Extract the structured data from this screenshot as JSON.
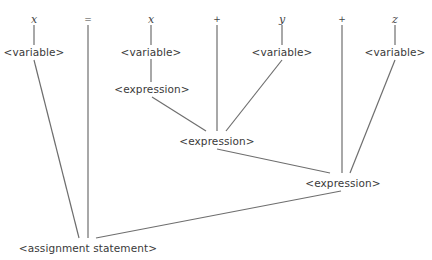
{
  "diagram": {
    "type": "parse-tree",
    "terminals": [
      {
        "id": "t_x1",
        "label": "x",
        "x": 34,
        "y": 19,
        "kind": "identifier"
      },
      {
        "id": "t_eq",
        "label": "=",
        "x": 88,
        "y": 19,
        "kind": "operator"
      },
      {
        "id": "t_x2",
        "label": "x",
        "x": 151,
        "y": 19,
        "kind": "identifier"
      },
      {
        "id": "t_plus1",
        "label": "+",
        "x": 217,
        "y": 19,
        "kind": "operator"
      },
      {
        "id": "t_y",
        "label": "y",
        "x": 282,
        "y": 19,
        "kind": "identifier"
      },
      {
        "id": "t_plus2",
        "label": "+",
        "x": 342,
        "y": 19,
        "kind": "operator"
      },
      {
        "id": "t_z",
        "label": "z",
        "x": 395,
        "y": 19,
        "kind": "identifier"
      }
    ],
    "nonterminals": [
      {
        "id": "v1",
        "label": "<variable>",
        "x": 34,
        "y": 52
      },
      {
        "id": "v2",
        "label": "<variable>",
        "x": 151,
        "y": 52
      },
      {
        "id": "v3",
        "label": "<variable>",
        "x": 282,
        "y": 52
      },
      {
        "id": "v4",
        "label": "<variable>",
        "x": 395,
        "y": 52
      },
      {
        "id": "e1",
        "label": "<expression>",
        "x": 152,
        "y": 89
      },
      {
        "id": "e2",
        "label": "<expression>",
        "x": 217,
        "y": 141
      },
      {
        "id": "e3",
        "label": "<expression>",
        "x": 343,
        "y": 183
      },
      {
        "id": "root",
        "label": "<assignment statement>",
        "x": 88,
        "y": 248
      }
    ],
    "edges": [
      {
        "from": "t_x1",
        "to": "v1",
        "x1": 34,
        "y1": 25,
        "x2": 34,
        "y2": 45
      },
      {
        "from": "t_x2",
        "to": "v2",
        "x1": 151,
        "y1": 25,
        "x2": 151,
        "y2": 45
      },
      {
        "from": "t_y",
        "to": "v3",
        "x1": 282,
        "y1": 25,
        "x2": 282,
        "y2": 45
      },
      {
        "from": "t_z",
        "to": "v4",
        "x1": 395,
        "y1": 25,
        "x2": 395,
        "y2": 45
      },
      {
        "from": "v2",
        "to": "e1",
        "x1": 151,
        "y1": 59,
        "x2": 151,
        "y2": 82
      },
      {
        "from": "e1",
        "to": "e2",
        "x1": 152,
        "y1": 97,
        "x2": 206,
        "y2": 131
      },
      {
        "from": "t_plus1",
        "to": "e2",
        "x1": 217,
        "y1": 25,
        "x2": 217,
        "y2": 131
      },
      {
        "from": "v3",
        "to": "e2",
        "x1": 282,
        "y1": 60,
        "x2": 226,
        "y2": 131
      },
      {
        "from": "e2",
        "to": "e3",
        "x1": 217,
        "y1": 149,
        "x2": 330,
        "y2": 173
      },
      {
        "from": "t_plus2",
        "to": "e3",
        "x1": 342,
        "y1": 25,
        "x2": 342,
        "y2": 173
      },
      {
        "from": "v4",
        "to": "e3",
        "x1": 395,
        "y1": 60,
        "x2": 350,
        "y2": 173
      },
      {
        "from": "v1",
        "to": "root",
        "x1": 34,
        "y1": 60,
        "x2": 79,
        "y2": 238
      },
      {
        "from": "t_eq",
        "to": "root",
        "x1": 88,
        "y1": 25,
        "x2": 88,
        "y2": 238
      },
      {
        "from": "e3",
        "to": "root",
        "x1": 341,
        "y1": 191,
        "x2": 96,
        "y2": 238
      }
    ],
    "colors": {
      "line": "#6e6e6e",
      "text": "#3a3a3a",
      "background": "#ffffff"
    }
  }
}
